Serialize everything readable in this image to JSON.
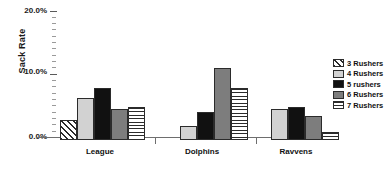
{
  "chart_data": {
    "type": "bar",
    "title": "",
    "xlabel": "",
    "ylabel": "Sack Rate",
    "categories": [
      "League",
      "Dolphins",
      "Ravvens"
    ],
    "ylim": [
      0,
      20
    ],
    "ytick_labels": [
      "0.0%",
      "10.0%",
      "20.0%"
    ],
    "ytick_values": [
      0,
      10,
      20
    ],
    "grid": false,
    "legend_position": "right",
    "series": [
      {
        "name": "3 Rushers",
        "pattern": "diagonal-hatch",
        "color": "#ffffff",
        "values": [
          3.2,
          0,
          0
        ]
      },
      {
        "name": "4 Rushers",
        "pattern": "solid",
        "color": "#d2d2d2",
        "values": [
          6.6,
          2.2,
          5.0
        ]
      },
      {
        "name": "5 rushers",
        "pattern": "solid",
        "color": "#111111",
        "values": [
          8.2,
          4.5,
          5.3
        ]
      },
      {
        "name": "6 Rushers",
        "pattern": "solid",
        "color": "#7d7d7d",
        "values": [
          5.0,
          11.5,
          3.8
        ]
      },
      {
        "name": "7 Rushers",
        "pattern": "horizontal-lines",
        "color": "#ffffff",
        "values": [
          5.3,
          8.3,
          1.2
        ]
      }
    ]
  },
  "axis": {
    "y_title": "Sack Rate",
    "y_top_label": "20.0%",
    "y_mid_label": "10.0%",
    "y_bottom_label": "0.0%"
  },
  "legend": {
    "items": [
      {
        "label": "3 Rushers"
      },
      {
        "label": "4 Rushers"
      },
      {
        "label": "5 rushers"
      },
      {
        "label": "6 Rushers"
      },
      {
        "label": "7 Rushers"
      }
    ]
  }
}
